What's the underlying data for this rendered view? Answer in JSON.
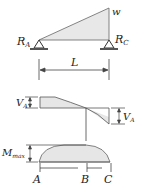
{
  "diagram": {
    "load_diagram": {
      "load_label": "w",
      "left_reaction_label": "R",
      "left_reaction_sub": "A",
      "right_reaction_label": "R",
      "right_reaction_sub": "C",
      "span_label": "L"
    },
    "shear_diagram": {
      "left_label": "V",
      "left_sub": "A",
      "right_label": "V",
      "right_sub": "A"
    },
    "moment_diagram": {
      "max_label": "M",
      "max_sub": "max",
      "points": [
        "A",
        "B",
        "C"
      ]
    },
    "colors": {
      "line": "#444444",
      "fill": "#e6e6e6",
      "support": "#333333"
    }
  }
}
